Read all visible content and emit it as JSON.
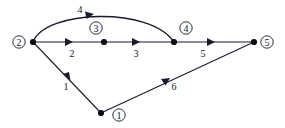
{
  "diagram": {
    "type": "directed-graph",
    "title": "",
    "background_color": "#ffffff",
    "stroke_color": "#1a1a2e",
    "nodes": [
      {
        "id": "1",
        "label": "1",
        "x": 101,
        "y": 113,
        "label_x": 119,
        "label_y": 115
      },
      {
        "id": "2",
        "label": "2",
        "x": 33,
        "y": 42,
        "label_x": 19,
        "label_y": 42
      },
      {
        "id": "3",
        "label": "3",
        "x": 104,
        "y": 42,
        "label_x": 96,
        "label_y": 28
      },
      {
        "id": "4",
        "label": "4",
        "x": 174,
        "y": 42,
        "label_x": 186,
        "label_y": 28
      },
      {
        "id": "5",
        "label": "5",
        "x": 254,
        "y": 42,
        "label_x": 267,
        "label_y": 42
      }
    ],
    "edges": [
      {
        "id": "e1",
        "label": "1",
        "from": "1",
        "to": "2",
        "shape": "line",
        "label_x": 66,
        "label_y": 86,
        "arrow_x": 63,
        "arrow_y": 74,
        "arrow_angle": 226
      },
      {
        "id": "e2",
        "label": "2",
        "from": "2",
        "to": "3",
        "shape": "line",
        "label_x": 72,
        "label_y": 53,
        "arrow_x": 70,
        "arrow_y": 42,
        "arrow_angle": 0
      },
      {
        "id": "e3",
        "label": "3",
        "from": "3",
        "to": "4",
        "shape": "line",
        "label_x": 136,
        "label_y": 53,
        "arrow_x": 137,
        "arrow_y": 42,
        "arrow_angle": 0
      },
      {
        "id": "e4",
        "label": "4",
        "from": "2",
        "to": "4",
        "shape": "arc",
        "label_x": 80,
        "label_y": 9,
        "arrow_x": 92,
        "arrow_y": 15,
        "arrow_angle": 5
      },
      {
        "id": "e5",
        "label": "5",
        "from": "4",
        "to": "5",
        "shape": "line",
        "label_x": 203,
        "label_y": 53,
        "arrow_x": 212,
        "arrow_y": 42,
        "arrow_angle": 0
      },
      {
        "id": "e6",
        "label": "6",
        "from": "1",
        "to": "5",
        "shape": "line",
        "label_x": 174,
        "label_y": 86,
        "arrow_x": 167,
        "arrow_y": 80,
        "arrow_angle": 335
      }
    ]
  }
}
